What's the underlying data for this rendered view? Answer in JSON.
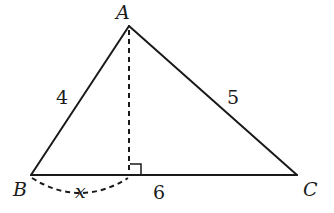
{
  "diagram": {
    "type": "triangle-with-altitude",
    "vertices": {
      "A": {
        "label": "A",
        "x": 129,
        "y": 26
      },
      "B": {
        "label": "B",
        "x": 31,
        "y": 175
      },
      "C": {
        "label": "C",
        "x": 297,
        "y": 175
      }
    },
    "altitude_foot": {
      "x": 129,
      "y": 175
    },
    "sides": {
      "AB": {
        "label": "4"
      },
      "AC": {
        "label": "5"
      },
      "BC": {
        "label": "6"
      }
    },
    "unknown_segment": {
      "from": "B",
      "to": "altitude_foot",
      "label": "x"
    },
    "right_angle_marker": true,
    "colors": {
      "stroke": "#1a1a1a",
      "background": "#ffffff"
    }
  }
}
